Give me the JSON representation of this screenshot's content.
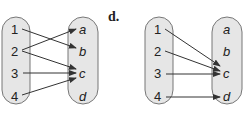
{
  "part_label": "d.",
  "diagrams": [
    {
      "domain": [
        "1",
        "2",
        "3",
        "4"
      ],
      "codomain": [
        "a",
        "b",
        "c",
        "d"
      ],
      "mappings": [
        [
          "1",
          "b"
        ],
        [
          "2",
          "a"
        ],
        [
          "2",
          "c"
        ],
        [
          "3",
          "c"
        ],
        [
          "4",
          "c"
        ]
      ]
    },
    {
      "domain": [
        "1",
        "2",
        "3",
        "4"
      ],
      "codomain": [
        "a",
        "b",
        "c",
        "d"
      ],
      "mappings": [
        [
          "1",
          "c"
        ],
        [
          "2",
          "c"
        ],
        [
          "3",
          "c"
        ],
        [
          "4",
          "d"
        ]
      ]
    }
  ],
  "colors": {
    "oval_fill": "#e6e6e6",
    "oval_stroke": "#777777",
    "arrow": "#333333"
  }
}
